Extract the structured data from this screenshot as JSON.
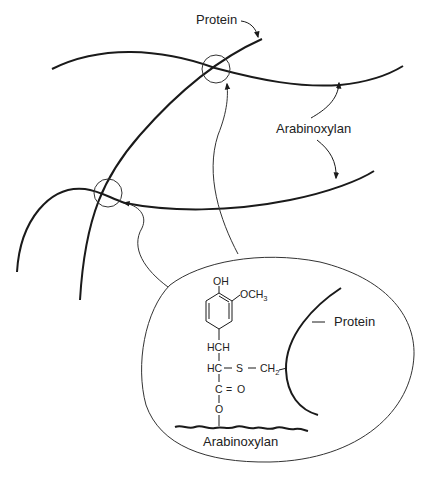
{
  "diagram": {
    "type": "schematic",
    "colors": {
      "stroke": "#1a1a1a",
      "text": "#222222",
      "background": "#ffffff"
    },
    "labels": {
      "protein_top": "Protein",
      "arabinoxylan_right": "Arabinoxylan",
      "protein_inset": "Protein",
      "arabinoxylan_inset": "Arabinoxylan"
    },
    "molecule": {
      "oh": "OH",
      "och3_main": "OCH",
      "och3_sub": "3",
      "hch": "HCH",
      "hc": "HC",
      "dash1": "–",
      "s": "S",
      "dash2": "–",
      "ch2_main": "CH",
      "ch2_sub": "2",
      "c": "C",
      "double_bond": "=",
      "o_carbonyl": "O",
      "o_ester": "O"
    },
    "nodes": [
      {
        "id": "crosslink-top",
        "shape": "circle"
      },
      {
        "id": "crosslink-left",
        "shape": "circle"
      },
      {
        "id": "inset-detail",
        "shape": "ellipse"
      }
    ],
    "edges": [
      {
        "from": "inset-detail",
        "to": "crosslink-top",
        "kind": "arrow"
      },
      {
        "from": "inset-detail",
        "to": "crosslink-left",
        "kind": "arrow"
      },
      {
        "from": "label-protein",
        "to": "protein-strand",
        "kind": "arrow"
      },
      {
        "from": "label-arabinoxylan",
        "to": "arabinoxylan-strand-top",
        "kind": "arrow"
      },
      {
        "from": "label-arabinoxylan",
        "to": "arabinoxylan-strand-bottom",
        "kind": "arrow"
      }
    ]
  }
}
